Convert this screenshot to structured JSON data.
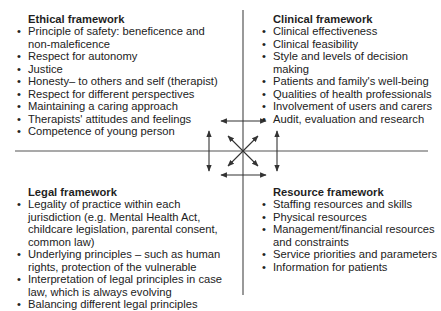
{
  "diagram": {
    "type": "four-quadrant framework diagram",
    "line_color": "#555555",
    "text_color": "#222222",
    "center": {
      "x": 243,
      "y": 151
    }
  },
  "quadrants": {
    "ethical": {
      "title": "Ethical framework",
      "items": [
        "Principle of safety: beneficence and non-maleficence",
        "Respect for autonomy",
        "Justice",
        "Honesty– to others and self (therapist)",
        "Respect for different perspectives",
        "Maintaining a caring approach",
        "Therapists' attitudes and feelings",
        "Competence of young person"
      ]
    },
    "clinical": {
      "title": "Clinical framework",
      "items": [
        "Clinical effectiveness",
        "Clinical feasibility",
        "Style and levels of decision making",
        "Patients and family's well-being",
        "Qualities of health professionals",
        "Involvement of users and carers",
        "Audit, evaluation and research"
      ]
    },
    "legal": {
      "title": "Legal framework",
      "items": [
        "Legality of practice within each jurisdiction (e.g. Mental Health Act, childcare legislation, parental consent, common law)",
        "Underlying principles – such as human rights, protection of the vulnerable",
        "Interpretation of legal principles in case law, which is always evolving",
        "Balancing different legal principles"
      ]
    },
    "resource": {
      "title": "Resource framework",
      "items": [
        "Staffing resources and skills",
        "Physical resources",
        "Management/financial resources and constraints",
        "Service priorities and parameters",
        "Information for patients"
      ]
    }
  }
}
